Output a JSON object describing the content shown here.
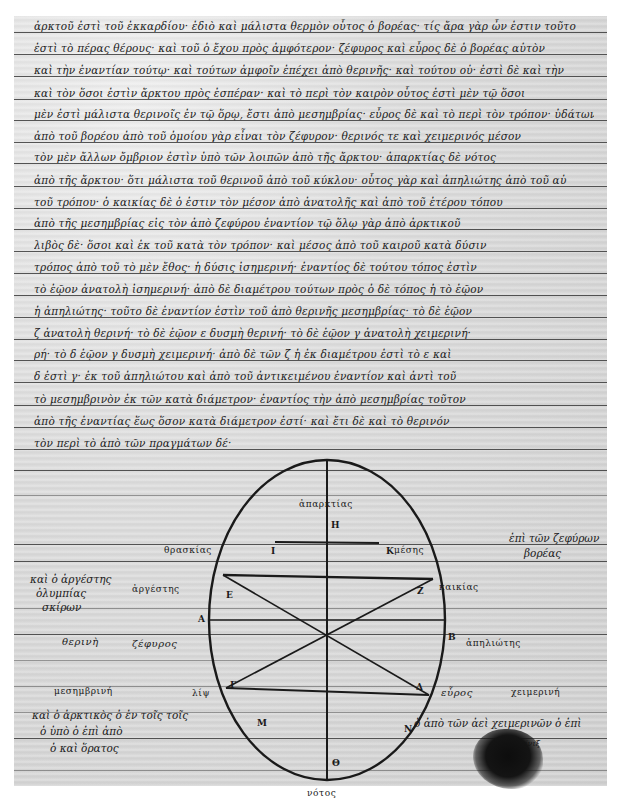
{
  "document": {
    "type": "manuscript-page",
    "language": "Greek",
    "text_lines": [
      "ἀρκτοῦ ἐστὶ τοῦ ἐκκαρδίου· ἐδιὸ καὶ μάλιστα θερμὸν οὗτος ὁ βορέας· τίς ἄρα γὰρ ὦν ἐστιν τοῦτο",
      "ἐστὶ τὸ πέρας θέρους· καὶ τοῦ ὁ ἔχου πρὸς ἀμφότερον· ζέφυρος καὶ εὖρος δὲ ὁ βορέας αὐτὸν",
      "καὶ τὴν ἐναντίαν τούτῳ· καὶ τούτων ἀμφοῖν ἐπέχει ἀπὸ θερινῆς· καὶ τούτου οὐ· ἐστὶ δὲ καὶ τὴν",
      "καὶ τὸν ὅσοι ἐστὶν ἄρκτου πρὸς ἑσπέραν· καὶ τὸ περὶ τὸν καιρὸν οὗτος ἐστὶ μὲν τῷ ὅσοι",
      "μὲν ἐστὶ μάλιστα θερινοῖς ἐν τῷ ὅρῳ, ἔστι ἀπὸ μεσημβρίας· εὖρος δὲ καὶ τὸ περὶ τὸν τρόπον· ὑδάτων καὶ ἀπαρκτίας δὲ",
      "ἀπὸ τοῦ βορέου ἀπὸ τοῦ ὁμοίου γὰρ εἶναι τὸν ζέφυρον· θερινός τε καὶ χειμερινός μέσον",
      "τὸν μὲν ἄλλων ὄμβριον ἐστὶν ὑπὸ τῶν λοιπῶν ἀπὸ τῆς ἄρκτου· ἀπαρκτίας δὲ νότος",
      "ἀπὸ τῆς ἄρκτου· ὅτι μάλιστα τοῦ θερινοῦ ἀπὸ τοῦ κύκλου· οὗτος γὰρ καὶ ἀπηλιώτης ἀπὸ τοῦ αὐ",
      "τοῦ τρόπου· ὁ καικίας δὲ ὁ ἐστιν τὸν μέσον ἀπὸ ἀνατολῆς καὶ ἀπὸ τοῦ ἑτέρου τόπου",
      "ἀπὸ τῆς μεσημβρίας εἰς τὸν ἀπὸ ζεφύρου ἐναντίον τῷ ὅλῳ γὰρ ἀπὸ ἀρκτικοῦ",
      "λιβὸς δὲ· ὅσοι καὶ ἐκ τοῦ κατὰ τὸν τρόπον· καὶ μέσος ἀπὸ τοῦ καιροῦ κατὰ δύσιν",
      "τρόπος ἀπὸ τοῦ τὸ μὲν ἔθος· ἡ δύσις ἰσημερινή· ἐναντίος δὲ τούτου τόπος ἐστὶν",
      "τὸ ἑῷον ἀνατολὴ ἰσημερινή· ἀπὸ δὲ διαμέτρου τούτων πρὸς ὁ δὲ τόπος ἡ τὸ ἑῷον",
      "ἡ ἀπηλιώτης· τοῦτο δὲ ἐναντίον ἐστὶν τοῦ ἀπὸ θερινῆς μεσημβρίας· τὸ δὲ ἑῷον",
      "ζ ἀνατολὴ θερινή· τὸ δὲ ἑῷον ε δυσμὴ θερινή· τὸ δὲ ἑῷον γ ἀνατολὴ χειμερινή·",
      "ρή· τὸ δ ἑῷον γ δυσμὴ χειμερινή· ἀπὸ δὲ τῶν ζ ἡ ἐκ διαμέτρου ἐστὶ τὸ ε καὶ",
      "δ ἐστὶ γ· ἐκ τοῦ ἀπηλιώτου καὶ ἀπὸ τοῦ ἀντικειμένου ἐναντίον καὶ ἀντὶ τοῦ",
      "τὸ μεσημβρινὸν ἐκ τῶν κατὰ διάμετρον· ἐναντίος τὴν ἀπὸ μεσημβρίας τοῦτον",
      "ἀπὸ τῆς ἐναντίας ἕως ὅσον κατὰ διάμετρον ἐστί· καὶ ἔτι δὲ καὶ τὸ θερινόν",
      "τὸν περὶ τὸ ἀπὸ τῶν πραγμάτων δέ·"
    ],
    "rule_lines_y": [
      32,
      54,
      76,
      99,
      120,
      142,
      163,
      186,
      208,
      229,
      251,
      273,
      295,
      317,
      339,
      360,
      382,
      405,
      427,
      449,
      470,
      495,
      544,
      561,
      608,
      634,
      660,
      686,
      712,
      738,
      770
    ]
  },
  "diagram": {
    "outer_labels": {
      "top": "ἀπαρκτίας",
      "top_left": "θρασκίας",
      "top_right": "μέσης",
      "upper_left": "ἀργέστης",
      "upper_right": "καικίας",
      "left": "ζέφυρος",
      "right": "ἀπηλιώτης",
      "lower_left": "λίψ",
      "lower_right": "εὖρος",
      "bottom": "νότος"
    },
    "inner_letters": {
      "top": "Η",
      "upper_left_chord": "Ι",
      "upper_right_chord": "Κ",
      "left_upper": "Ε",
      "right_upper": "Ζ",
      "left": "Α",
      "right": "Β",
      "left_lower": "Γ",
      "right_lower": "Δ",
      "bottom_left": "Μ",
      "bottom_right": "Ν",
      "bottom": "Θ",
      "center": "Λ"
    },
    "side_labels": {
      "left_upper_season": "θερινὴ",
      "left_lower_season": "μεσημβρινή",
      "right_lower_season": "χειμερινή"
    }
  },
  "marginal_notes": {
    "top_right": [
      "ἐπὶ τῶν ζεφύρων",
      "βορέας"
    ],
    "left_upper": [
      "καὶ ὁ ἀργέστης",
      "ὀλυμπίας",
      "σκίρων"
    ],
    "left_lower": [
      "καὶ ὁ ἀρκτικὸς ὁ ἐν τοῖς τοῖς",
      "ὁ ὑπὸ ὁ ἐπὶ ἀπὸ",
      "ὁ καὶ ὅρατος"
    ],
    "right_lower": [
      "ὁ ἀπὸ τῶν ἀεὶ χειμερινῶν ὁ ἐπὶ",
      "φοίνιξ"
    ]
  },
  "colors": {
    "paper": "#d9d9d9",
    "ink": "#1c1c1c",
    "rule": "#3a3a3a",
    "margin": "#ffffff"
  }
}
